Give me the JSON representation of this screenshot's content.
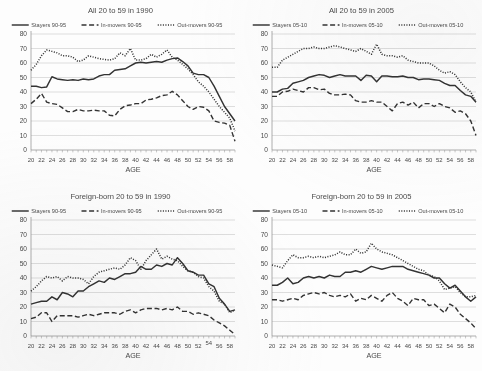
{
  "figure": {
    "background": "#fdfdfd",
    "ink": "#333333",
    "grid_color": "#c9c9c9",
    "axis_color": "#9a9a9a",
    "text_color": "#4a4a4a"
  },
  "panels": [
    {
      "id": "panel-all-1990",
      "title": "All 20 to 59 in 1990",
      "legend": [
        {
          "label": "Stayers 90-95",
          "style": "solid"
        },
        {
          "label": "In-movers 90-95",
          "style": "dashed"
        },
        {
          "label": "Out-movers 90-95",
          "style": "dotted"
        }
      ],
      "chart_data": {
        "type": "line",
        "title": "All 20 to 59 in 1990",
        "xlabel": "AGE",
        "ylabel": "",
        "xlim": [
          20,
          59
        ],
        "ylim": [
          0,
          80
        ],
        "ytick_step": 10,
        "grid": true,
        "legend_position": "top",
        "x": [
          20,
          21,
          22,
          23,
          24,
          25,
          26,
          27,
          28,
          29,
          30,
          31,
          32,
          33,
          34,
          35,
          36,
          37,
          38,
          39,
          40,
          41,
          42,
          43,
          44,
          45,
          46,
          47,
          48,
          49,
          50,
          51,
          52,
          53,
          54,
          55,
          56,
          57,
          58,
          59
        ],
        "xticks": [
          20,
          22,
          24,
          26,
          28,
          30,
          32,
          34,
          36,
          38,
          40,
          42,
          44,
          46,
          48,
          50,
          52,
          54,
          56,
          58
        ],
        "series": [
          {
            "name": "Stayers 90-95",
            "style": "solid",
            "values": [
              44,
              44,
              43,
              43.5,
              50.5,
              49,
              48.5,
              48,
              48.5,
              48,
              49,
              48.5,
              49,
              51,
              52,
              52,
              55,
              55.5,
              56,
              58,
              60,
              60.5,
              60,
              60.5,
              61,
              60.5,
              62,
              63,
              63.5,
              61,
              58,
              53,
              52,
              52,
              50,
              44,
              37,
              30,
              25,
              20
            ]
          },
          {
            "name": "In-movers 90-95",
            "style": "dashed",
            "values": [
              32,
              35,
              39,
              33,
              32,
              31.5,
              29,
              26.5,
              26.5,
              28,
              27,
              27,
              27.5,
              27,
              27,
              24,
              23.5,
              28,
              30.5,
              31,
              32,
              32,
              34.5,
              35,
              36,
              37.5,
              38,
              40.5,
              38,
              34,
              30,
              28,
              30,
              29.5,
              27,
              20,
              19,
              18.5,
              17,
              6
            ]
          },
          {
            "name": "Out-movers 90-95",
            "style": "dotted",
            "values": [
              55,
              59,
              65,
              69,
              68,
              67,
              65,
              65,
              64,
              61,
              62,
              65,
              64,
              63,
              62.5,
              62,
              63,
              67,
              65,
              70,
              62,
              62,
              63,
              66,
              64,
              66,
              69,
              64,
              62,
              59,
              56,
              52,
              47,
              44,
              40,
              35,
              30,
              26,
              22,
              13
            ]
          }
        ]
      }
    },
    {
      "id": "panel-all-2005",
      "title": "All 20 to 59 in 2005",
      "legend": [
        {
          "label": "Stayers 05-10",
          "style": "solid"
        },
        {
          "label": "In-movers 05-10",
          "style": "dashed"
        },
        {
          "label": "Out-movers 05-10",
          "style": "dotted"
        }
      ],
      "chart_data": {
        "type": "line",
        "title": "All 20 to 59 in 2005",
        "xlabel": "AGE",
        "ylabel": "",
        "xlim": [
          20,
          59
        ],
        "ylim": [
          0,
          80
        ],
        "ytick_step": 10,
        "grid": true,
        "legend_position": "top",
        "x": [
          20,
          21,
          22,
          23,
          24,
          25,
          26,
          27,
          28,
          29,
          30,
          31,
          32,
          33,
          34,
          35,
          36,
          37,
          38,
          39,
          40,
          41,
          42,
          43,
          44,
          45,
          46,
          47,
          48,
          49,
          50,
          51,
          52,
          53,
          54,
          55,
          56,
          57,
          58,
          59
        ],
        "xticks": [
          20,
          22,
          24,
          26,
          28,
          30,
          32,
          34,
          36,
          38,
          40,
          42,
          44,
          46,
          48,
          50,
          52,
          54,
          56,
          58
        ],
        "series": [
          {
            "name": "Stayers 05-10",
            "style": "solid",
            "values": [
              40,
              40,
              42,
              42.5,
              46,
              47,
              48,
              50,
              51,
              52,
              51.5,
              50,
              51,
              52,
              51,
              51,
              51,
              48,
              51.5,
              51,
              47,
              51,
              51,
              50.5,
              50.5,
              51,
              50,
              50,
              48.5,
              49,
              49,
              48.5,
              48,
              46,
              44.5,
              44.5,
              41,
              38,
              37,
              33
            ]
          },
          {
            "name": "In-movers 05-10",
            "style": "dashed",
            "values": [
              37,
              37,
              40,
              40.5,
              42,
              41,
              40,
              43,
              43,
              41.5,
              42,
              39,
              38,
              38,
              38.5,
              38,
              34,
              33,
              33,
              34,
              33,
              33,
              30,
              27,
              32,
              33,
              31,
              33,
              29,
              32,
              32,
              30,
              32,
              30,
              29,
              26,
              27,
              25,
              20,
              10
            ]
          },
          {
            "name": "Out-movers 05-10",
            "style": "dotted",
            "values": [
              57,
              57,
              62,
              64,
              66,
              68,
              70,
              70,
              71,
              70,
              70,
              71,
              72,
              71,
              70,
              69,
              68,
              70,
              68,
              66,
              73,
              66,
              65,
              65,
              64,
              65,
              62,
              61,
              60,
              60,
              60,
              58,
              55,
              53,
              54,
              52,
              47,
              43,
              40,
              33
            ]
          }
        ]
      }
    },
    {
      "id": "panel-foreign-1990",
      "title": "Foreign-born 20 to 59 in 1990",
      "legend": [
        {
          "label": "Stayers 90-95",
          "style": "solid"
        },
        {
          "label": "In-movers 90-95",
          "style": "dashed"
        },
        {
          "label": "Out-movers 90-95",
          "style": "dotted"
        }
      ],
      "chart_data": {
        "type": "line",
        "title": "Foreign-born 20 to 59 in 1990",
        "xlabel": "AGE",
        "ylabel": "",
        "xlim": [
          20,
          59
        ],
        "ylim": [
          0,
          80
        ],
        "ytick_step": 10,
        "grid": true,
        "legend_position": "top",
        "x": [
          20,
          21,
          22,
          23,
          24,
          25,
          26,
          27,
          28,
          29,
          30,
          31,
          32,
          33,
          34,
          35,
          36,
          37,
          38,
          39,
          40,
          41,
          42,
          43,
          44,
          45,
          46,
          47,
          48,
          49,
          50,
          51,
          52,
          53,
          54,
          55,
          56,
          57,
          58,
          59
        ],
        "xticks": [
          20,
          22,
          24,
          26,
          28,
          30,
          32,
          34,
          36,
          38,
          40,
          42,
          44,
          46,
          48,
          50,
          52,
          54,
          56,
          58
        ],
        "series": [
          {
            "name": "Stayers 90-95",
            "style": "solid",
            "values": [
              22,
              23,
              24,
              24,
              27,
              25,
              30,
              29,
              27,
              31,
              31,
              34,
              36,
              38,
              37,
              40,
              39,
              41,
              43,
              43,
              44,
              48,
              46,
              46,
              49,
              48,
              50,
              49,
              54,
              50,
              45,
              44,
              42,
              42,
              36,
              34,
              26,
              22,
              17,
              18
            ]
          },
          {
            "name": "In-movers 90-95",
            "style": "dashed",
            "values": [
              12,
              13,
              16,
              16,
              10,
              14,
              14,
              14,
              14,
              13,
              14,
              15,
              14,
              15,
              16,
              16,
              16,
              15,
              17,
              18,
              16,
              18,
              19,
              19,
              19,
              18,
              19,
              18,
              20,
              17,
              17,
              15,
              16,
              15,
              14,
              11,
              9,
              7,
              4,
              1
            ]
          },
          {
            "name": "Out-movers 90-95",
            "style": "dotted",
            "values": [
              31,
              34,
              38,
              41,
              40,
              41,
              38,
              41,
              40,
              40,
              39,
              36,
              41,
              44,
              45,
              46,
              47,
              46,
              49,
              54,
              52,
              46,
              52,
              56,
              60,
              53,
              55,
              53,
              52,
              48,
              45,
              44,
              41,
              40,
              34,
              31,
              24,
              22,
              16,
              18
            ]
          }
        ]
      }
    },
    {
      "id": "panel-foreign-2005",
      "title": "Foreign-born 20 to 59 in 2005",
      "legend": [
        {
          "label": "Stayers 05-10",
          "style": "solid"
        },
        {
          "label": "In-movers 05-10",
          "style": "dashed"
        },
        {
          "label": "Out-movers 05-10",
          "style": "dotted"
        }
      ],
      "chart_data": {
        "type": "line",
        "title": "Foreign-born 20 to 59 in 2005",
        "xlabel": "AGE",
        "ylabel": "",
        "xlim": [
          20,
          59
        ],
        "ylim": [
          0,
          80
        ],
        "ytick_step": 10,
        "grid": true,
        "legend_position": "top",
        "x": [
          20,
          21,
          22,
          23,
          24,
          25,
          26,
          27,
          28,
          29,
          30,
          31,
          32,
          33,
          34,
          35,
          36,
          37,
          38,
          39,
          40,
          41,
          42,
          43,
          44,
          45,
          46,
          47,
          48,
          49,
          50,
          51,
          52,
          53,
          54,
          55,
          56,
          57,
          58,
          59
        ],
        "xticks": [
          20,
          22,
          24,
          26,
          28,
          30,
          32,
          34,
          36,
          38,
          40,
          42,
          44,
          46,
          48,
          50,
          52,
          54,
          56,
          58
        ],
        "series": [
          {
            "name": "Stayers 05-10",
            "style": "solid",
            "values": [
              35,
              35,
              37,
              40,
              36,
              37,
              40,
              41,
              40,
              41,
              40,
              42,
              41,
              41,
              44,
              44,
              45,
              44,
              46,
              48,
              47,
              46,
              47,
              48,
              48,
              48,
              46,
              45,
              44,
              43,
              42,
              40,
              40,
              36,
              33,
              35,
              31,
              27,
              24,
              27
            ]
          },
          {
            "name": "In-movers 05-10",
            "style": "dashed",
            "values": [
              25,
              25,
              24,
              25,
              26,
              25,
              28,
              29,
              30,
              29,
              30,
              28,
              27,
              28,
              27,
              29,
              24,
              26,
              25,
              28,
              26,
              24,
              28,
              30,
              26,
              24,
              21,
              26,
              25,
              25,
              21,
              22,
              19,
              16,
              22,
              20,
              15,
              12,
              9,
              5
            ]
          },
          {
            "name": "Out-movers 05-10",
            "style": "dotted",
            "values": [
              49,
              48,
              47,
              52,
              56,
              54,
              54,
              55,
              54,
              55,
              54,
              55,
              56,
              58,
              56,
              56,
              60,
              57,
              58,
              64,
              60,
              58,
              57,
              56,
              54,
              52,
              50,
              48,
              46,
              45,
              42,
              41,
              38,
              32,
              33,
              34,
              30,
              27,
              27,
              28
            ]
          }
        ]
      }
    }
  ]
}
